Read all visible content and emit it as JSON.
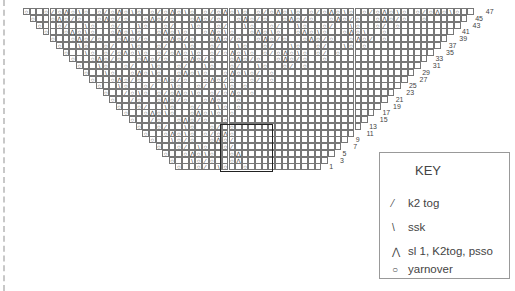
{
  "chart_title": "Lace shawl knitting chart",
  "rows": [
    {
      "num": "47",
      "pattern": "O  O/OAO\\O O/OAO\\O O/OAO\\O O/OAO\\O O/OAO\\O O/OAO\\O O/OAO\\O O/OAO\\O  O "
    },
    {
      "num": "45",
      "pattern": "O  OAO/O  OAO/O  OAO/O  OAO/O  OAO/O  OAO/O  OAO/O  OAO/O  O"
    },
    {
      "num": "43",
      "pattern": "O  O/  \\O  O/  \\O  O/  \\O  O/  \\O  O/  \\O  O/  \\O  O/ O"
    },
    {
      "num": "41",
      "pattern": "O  OAO\\O  OAO\\O  OAO\\O  OAO\\O  OAO\\O  OAO\\O  OAO\\  O"
    },
    {
      "num": "39",
      "pattern": "O  OAO/O  OAO/O  OAO/O  OAO/O  OAO/O  OAO/O  OAO/ O"
    },
    {
      "num": "37",
      "pattern": "O  \\O  O/  \\O  O/  \\O  O/  \\O  O/  \\O  O/  \\O O"
    },
    {
      "num": "35",
      "pattern": "O  \\O O/OAO\\O O/OAO\\O O/OAO\\O O/OAO\\O O/ O"
    },
    {
      "num": "33",
      "pattern": "O  OAO/O  OAO/O  OAO/O  OAO/O  OAO/O  O"
    },
    {
      "num": "31",
      "pattern": "O  \\O  O/  \\O  O/  \\O  O/  \\O  O/ O"
    },
    {
      "num": "29",
      "pattern": "O  \\O  OAO\\O  OAO\\O  OAO\\O/ O"
    },
    {
      "num": "27",
      "pattern": "O  OAO/O  OAO/O  OAO/O  O/ O"
    },
    {
      "num": "25",
      "pattern": "O  \\O  O/  \\O  O/  \\O O"
    },
    {
      "num": "23",
      "pattern": "O  /O\\O O/OAO\\O O/OAO O"
    },
    {
      "num": "21",
      "pattern": "O  /O  OAO/O  OAO  O"
    },
    {
      "num": "19",
      "pattern": "O  O/  \\O  O/  \\O O"
    },
    {
      "num": "17",
      "pattern": "O  OAO\\O  OAO\\O O"
    },
    {
      "num": "15",
      "pattern": "O  /O  OAO/O  O"
    },
    {
      "num": "13",
      "pattern": "O  O/  \\O  O/ O"
    },
    {
      "num": "11",
      "pattern": "O  OAO\\O O/OAO"
    },
    {
      "num": "9",
      "pattern": "O  \\O/O  OAO/"
    },
    {
      "num": "7",
      "pattern": "O  O/ \\O  O/"
    },
    {
      "num": "5",
      "pattern": "O  OAO\\O  OA"
    },
    {
      "num": "3",
      "pattern": "O  \\O/O  OA"
    },
    {
      "num": "1",
      "pattern": "O  O/ \\O  O"
    }
  ],
  "key": {
    "title": "KEY",
    "items": [
      {
        "symbol": "/",
        "glyph": "⁄",
        "label": "k2 tog"
      },
      {
        "symbol": "\\",
        "glyph": "\\",
        "label": "ssk"
      },
      {
        "symbol": "A",
        "glyph": "⋀",
        "label": "sl 1, K2tog, psso"
      },
      {
        "symbol": "O",
        "glyph": "○",
        "label": "yarnover"
      }
    ]
  }
}
